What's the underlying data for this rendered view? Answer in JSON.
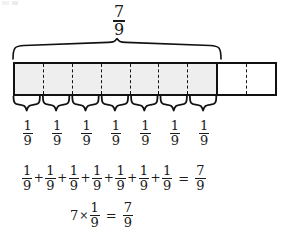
{
  "figure": {
    "title_fraction": {
      "numerator": "7",
      "denominator": "9"
    },
    "bar_model": {
      "total_parts": 9,
      "shaded_parts": 7,
      "shaded_color": "#eeeeee",
      "outline_color": "#111111",
      "divider_style": "dashed",
      "group_divider_style": "solid"
    },
    "top_brace": {
      "spans_parts": 7,
      "label": {
        "numerator": "7",
        "denominator": "9"
      }
    },
    "unit_labels": [
      {
        "numerator": "1",
        "denominator": "9"
      },
      {
        "numerator": "1",
        "denominator": "9"
      },
      {
        "numerator": "1",
        "denominator": "9"
      },
      {
        "numerator": "1",
        "denominator": "9"
      },
      {
        "numerator": "1",
        "denominator": "9"
      },
      {
        "numerator": "1",
        "denominator": "9"
      },
      {
        "numerator": "1",
        "denominator": "9"
      }
    ],
    "equation_sum": {
      "terms": [
        {
          "numerator": "1",
          "denominator": "9"
        },
        {
          "numerator": "1",
          "denominator": "9"
        },
        {
          "numerator": "1",
          "denominator": "9"
        },
        {
          "numerator": "1",
          "denominator": "9"
        },
        {
          "numerator": "1",
          "denominator": "9"
        },
        {
          "numerator": "1",
          "denominator": "9"
        },
        {
          "numerator": "1",
          "denominator": "9"
        }
      ],
      "plus": "+",
      "equals": "=",
      "result": {
        "numerator": "7",
        "denominator": "9"
      }
    },
    "equation_product": {
      "multiplier": "7",
      "times": "×",
      "factor": {
        "numerator": "1",
        "denominator": "9"
      },
      "equals": "=",
      "result": {
        "numerator": "7",
        "denominator": "9"
      }
    }
  }
}
